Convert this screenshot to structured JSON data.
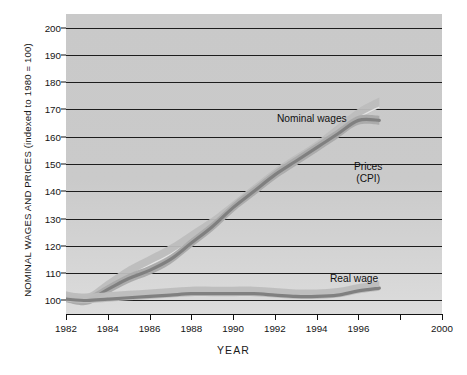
{
  "chart_data": {
    "type": "line",
    "title": "",
    "xlabel": "YEAR",
    "ylabel": "NOMINAL WAGES AND PRICES (indexed to 1980 = 100)",
    "xlim": [
      1982,
      2000
    ],
    "ylim": [
      95,
      205
    ],
    "yticks": [
      100,
      110,
      120,
      130,
      140,
      150,
      160,
      170,
      180,
      190,
      200
    ],
    "xticks": [
      1982,
      1984,
      1986,
      1988,
      1990,
      1992,
      1994,
      1996,
      1998,
      2000
    ],
    "xtick_labels": [
      "1982",
      "1984",
      "1986",
      "1988",
      "1990",
      "1992",
      "1994",
      "1996",
      "",
      "2000"
    ],
    "grid": "horizontal",
    "legend": "inline-annotations",
    "x": [
      1982,
      1983,
      1984,
      1985,
      1986,
      1987,
      1988,
      1989,
      1990,
      1991,
      1992,
      1993,
      1994,
      1995,
      1996,
      1997
    ],
    "series": [
      {
        "name": "Nominal wages",
        "color": "#b0b0b0",
        "values": [
          101,
          100,
          105,
          110,
          114,
          118,
          123,
          128,
          134,
          140,
          146,
          151,
          156,
          162,
          168,
          172
        ]
      },
      {
        "name": "Prices (CPI)",
        "color": "#8a8a8a",
        "values": [
          101,
          100,
          104,
          108,
          111,
          115,
          121,
          127,
          134,
          140,
          146,
          151,
          156,
          161,
          166,
          166
        ]
      },
      {
        "name": "Real wage",
        "color": "#8a8a8a",
        "values": [
          101,
          100.5,
          101,
          101.5,
          102,
          102.5,
          103,
          103,
          103,
          103,
          102.5,
          102,
          102,
          102.5,
          104,
          105
        ]
      }
    ],
    "annotations": [
      {
        "id": "nominal-wages",
        "text": "Nominal wages",
        "x_px": 277,
        "y_px": 120
      },
      {
        "id": "prices-cpi",
        "text": "Prices\n(CPI)",
        "line1": "Prices",
        "line2": "(CPI)",
        "x_px": 353,
        "y_px": 168
      },
      {
        "id": "real-wage",
        "text": "Real wage",
        "x_px": 330,
        "y_px": 279
      }
    ],
    "colors": {
      "plot_background": "#cacaca",
      "gridline": "#1d1d1d",
      "band_light": "#bdbdbd",
      "band_dark": "#9c9c9c",
      "line_dark": "#808080",
      "text": "#141414"
    }
  },
  "axis": {
    "ytick_labels": [
      "200",
      "190",
      "180",
      "170",
      "160",
      "150",
      "140",
      "130",
      "120",
      "110",
      "100"
    ],
    "xtick_labels": [
      "1982",
      "1984",
      "1986",
      "1988",
      "1990",
      "1992",
      "1994",
      "1996",
      "2000"
    ]
  },
  "labels": {
    "y_axis_title": "NOMINAL WAGES AND PRICES (indexed to 1980 = 100)",
    "x_axis_title": "YEAR",
    "nominal_wages": "Nominal wages",
    "prices_line1": "Prices",
    "prices_line2": "(CPI)",
    "real_wage": "Real wage"
  }
}
